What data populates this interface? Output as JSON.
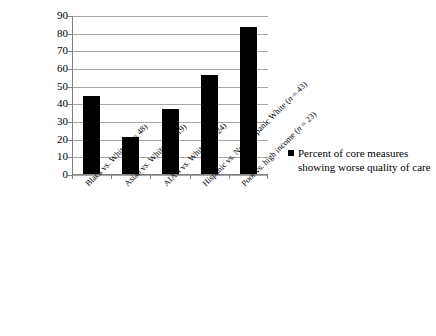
{
  "chart_data": {
    "type": "bar",
    "title": "",
    "subtitle": "",
    "xlabel": "",
    "ylabel": "",
    "ylim": [
      0,
      90
    ],
    "grid": true,
    "legend_position": "right",
    "categories": [
      "Black vs. White (n = 48)",
      "Asian vs. White (n = 19)",
      "AIAN vs. White (n = 24)",
      "Hispanic vs. Non-Hispanic White (n = 43)",
      "Poor vs. high income (n = 23)"
    ],
    "category_parts": [
      {
        "prefix": "Black vs. White (",
        "italic": "n",
        "suffix": " = 48)"
      },
      {
        "prefix": "Asian vs. White (",
        "italic": "n",
        "suffix": " = 19)"
      },
      {
        "prefix": "AIAN vs. White (",
        "italic": "n",
        "suffix": " = 24)"
      },
      {
        "prefix": "Hispanic vs. Non-Hispanic White (",
        "italic": "n",
        "suffix": " = 43)"
      },
      {
        "prefix": "Poor vs. high income (",
        "italic": "n",
        "suffix": " = 23)"
      }
    ],
    "series": [
      {
        "name": "Percent of core measures showing worse quality of care",
        "values": [
          44,
          21,
          37,
          56,
          83
        ],
        "color": "#000000"
      }
    ],
    "y_ticks": [
      0,
      10,
      20,
      30,
      40,
      50,
      60,
      70,
      80,
      90
    ],
    "y_tick_labels": [
      "0",
      "10",
      "20",
      "30",
      "40",
      "50",
      "60",
      "70",
      "80",
      "90"
    ]
  },
  "legend": {
    "marker_name": "legend-color-swatch",
    "label": "Percent of core measures showing worse quality of care",
    "color": "#000000"
  },
  "axis": {
    "gridline_color": "#a6a6a6",
    "axis_color": "#808080"
  },
  "source_note": {
    "text": ""
  }
}
